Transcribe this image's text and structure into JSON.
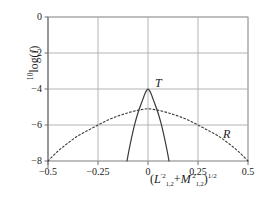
{
  "figure": {
    "background_color": "#ffffff",
    "frame_color": "#a8a8a8",
    "grid_color": "#b4b4b4",
    "curve_color": "#3a3a3a"
  },
  "axis": {
    "y_label_prefix": "10",
    "y_label_log": "log(",
    "y_label_var": "I",
    "y_label_close": ")",
    "x_label_open": "(",
    "x_label_var1": "L",
    "x_label_var1_sup": "′2",
    "x_label_var1_sub": "1,2",
    "x_label_plus": "+",
    "x_label_var2": "M",
    "x_label_var2_sup": "′2",
    "x_label_var2_sub": "1,2",
    "x_label_close": ")",
    "x_label_exp": "1/2"
  },
  "chart_data": {
    "type": "line",
    "title": "",
    "xlabel": "(L'²₁,₂ + M'²₁,₂)^(1/2)",
    "ylabel": "10log(I)",
    "xlim": [
      -0.5,
      0.5
    ],
    "ylim": [
      -8,
      0
    ],
    "xticks": [
      -0.5,
      -0.25,
      0,
      0.25,
      0.5
    ],
    "xtick_labels": [
      "−0.5",
      "−0.25",
      "0",
      "0.25",
      "0.5"
    ],
    "yticks": [
      0,
      -2,
      -4,
      -6,
      -8
    ],
    "ytick_labels": [
      "0",
      "−2",
      "−4",
      "−6",
      "−8"
    ],
    "grid": true,
    "legend": "none",
    "annotations": [
      {
        "text": "T",
        "x": 0.035,
        "y": -3.7
      },
      {
        "text": "R",
        "x": 0.375,
        "y": -6.55
      }
    ],
    "series": [
      {
        "name": "T",
        "style": "solid",
        "peak": {
          "x": 0.0,
          "y": -4.0
        },
        "x": [
          -0.105,
          -0.095,
          -0.085,
          -0.075,
          -0.065,
          -0.055,
          -0.045,
          -0.035,
          -0.025,
          -0.015,
          -0.005,
          0.0,
          0.005,
          0.015,
          0.025,
          0.035,
          0.045,
          0.055,
          0.065,
          0.075,
          0.085,
          0.095,
          0.105
        ],
        "y": [
          -8.0,
          -7.4,
          -6.85,
          -6.35,
          -5.9,
          -5.5,
          -5.15,
          -4.85,
          -4.55,
          -4.25,
          -4.05,
          -4.0,
          -4.05,
          -4.25,
          -4.55,
          -4.85,
          -5.15,
          -5.5,
          -5.9,
          -6.35,
          -6.85,
          -7.4,
          -8.0
        ]
      },
      {
        "name": "R",
        "style": "dashed",
        "peak": {
          "x": 0.0,
          "y": -5.1
        },
        "x": [
          -0.5,
          -0.45,
          -0.4,
          -0.35,
          -0.3,
          -0.25,
          -0.2,
          -0.15,
          -0.1,
          -0.05,
          0.0,
          0.05,
          0.1,
          0.15,
          0.2,
          0.25,
          0.3,
          0.35,
          0.4,
          0.45,
          0.5
        ],
        "y": [
          -8.0,
          -7.45,
          -7.0,
          -6.6,
          -6.3,
          -6.0,
          -5.72,
          -5.5,
          -5.32,
          -5.18,
          -5.1,
          -5.18,
          -5.32,
          -5.5,
          -5.72,
          -6.0,
          -6.3,
          -6.6,
          -7.0,
          -7.45,
          -8.0
        ]
      }
    ]
  }
}
